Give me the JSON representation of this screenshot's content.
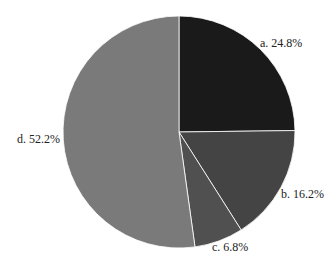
{
  "chart_data": {
    "type": "pie",
    "title": "",
    "categories": [
      "a",
      "b",
      "c",
      "d"
    ],
    "values": [
      24.8,
      16.2,
      6.8,
      52.2
    ],
    "labels": [
      "a. 24.8%",
      "b. 16.2%",
      "c. 6.8%",
      "d. 52.2%"
    ],
    "colors": [
      "#1a1a1a",
      "#444444",
      "#505050",
      "#7a7a7a"
    ],
    "start_angle": "12 o'clock",
    "direction": "clockwise",
    "legend": "none"
  }
}
